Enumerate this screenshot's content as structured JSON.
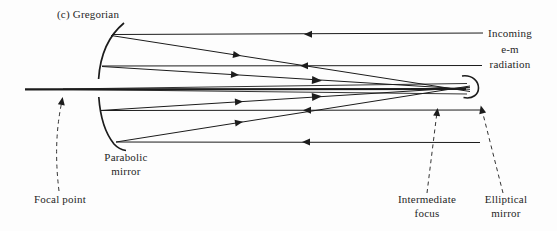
{
  "figure": {
    "title": "(c) Gregorian",
    "colors": {
      "ink": "#1c1c1c",
      "background": "#fdfdfd",
      "text": "#262626"
    },
    "labels": {
      "incoming_radiation": {
        "line1": "Incoming",
        "line2": "e-m",
        "line3": "radiation"
      },
      "parabolic_mirror": {
        "line1": "Parabolic",
        "line2": "mirror"
      },
      "focal_point": "Focal point",
      "intermediate_focus": {
        "line1": "Intermediate",
        "line2": "focus"
      },
      "elliptical_mirror": {
        "line1": "Elliptical",
        "line2": "mirror"
      }
    }
  }
}
